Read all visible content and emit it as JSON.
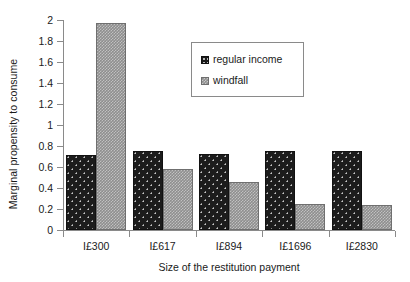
{
  "chart_data": {
    "type": "bar",
    "title": "",
    "xlabel": "Size of the restitution payment",
    "ylabel": "Marginal propensity to consume",
    "categories": [
      "I£300",
      "I£617",
      "I£894",
      "I£1696",
      "I£2830"
    ],
    "series": [
      {
        "name": "regular income",
        "values": [
          0.71,
          0.75,
          0.72,
          0.755,
          0.755
        ],
        "color": "#1c1c1c",
        "pattern": "dotted"
      },
      {
        "name": "windfall",
        "values": [
          1.97,
          0.58,
          0.455,
          0.25,
          0.24
        ],
        "color": "#8e8e8e",
        "pattern": "checkered"
      }
    ],
    "ylim": [
      0,
      2
    ],
    "ytick_step": 0.2,
    "yticks": [
      "2",
      "1.8",
      "1.6",
      "1.4",
      "1.2",
      "1",
      "0.8",
      "0.6",
      "0.4",
      "0.2",
      "0"
    ],
    "grid": false,
    "legend_position": "upper-center"
  },
  "legend": {
    "entries": [
      {
        "label": "regular income"
      },
      {
        "label": "windfall"
      }
    ]
  }
}
